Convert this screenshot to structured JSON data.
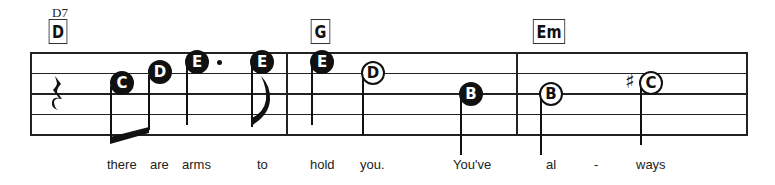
{
  "score": {
    "chords": [
      {
        "name": "D",
        "alt": "D7"
      },
      {
        "name": "G"
      },
      {
        "name": "Em"
      }
    ],
    "rest": {
      "type": "quarter-rest"
    },
    "notes": [
      {
        "letter": "C",
        "style": "filled",
        "duration": "eighth (beamed)"
      },
      {
        "letter": "D",
        "style": "filled",
        "duration": "eighth (beamed)"
      },
      {
        "letter": "E",
        "style": "filled",
        "duration": "dotted quarter"
      },
      {
        "letter": "E",
        "style": "filled",
        "duration": "eighth"
      },
      {
        "letter": "E",
        "style": "filled",
        "duration": "quarter"
      },
      {
        "letter": "D",
        "style": "open",
        "duration": "half"
      },
      {
        "letter": "B",
        "style": "filled",
        "duration": "quarter"
      },
      {
        "letter": "B",
        "style": "open",
        "duration": "half"
      },
      {
        "letter": "C",
        "style": "open",
        "duration": "half",
        "accidental": "♯"
      }
    ],
    "lyrics": [
      "there",
      "are",
      "arms",
      "to",
      "hold",
      "you.",
      "You've",
      "al",
      "-",
      "ways"
    ]
  }
}
